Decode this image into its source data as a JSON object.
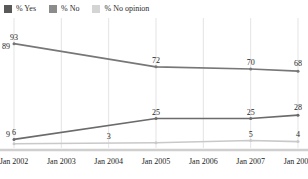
{
  "legend": {
    "position": "top-left",
    "items": [
      {
        "label": "% Yes",
        "color": "#595959",
        "swatch_icon": "square-swatch"
      },
      {
        "label": "% No",
        "color": "#8c8c8c",
        "swatch_icon": "square-swatch"
      },
      {
        "label": "% No opinion",
        "color": "#d4d4d4",
        "swatch_icon": "square-swatch"
      }
    ]
  },
  "axis": {
    "tick_labels": [
      "Jan 2002",
      "Jan 2003",
      "Jan 2004",
      "Jan 2005",
      "Jan 2006",
      "Jan 2007",
      "Jan 2008"
    ]
  },
  "chart_data": {
    "type": "line",
    "title": "",
    "subtitle": "",
    "xlabel": "",
    "ylabel": "",
    "grid": "vertical",
    "legend_position": "top-left",
    "ylim": [
      0,
      100
    ],
    "x": [
      "Jan 2002",
      "Jan 2003",
      "Jan 2004",
      "Jan 2005",
      "Jan 2006",
      "Jan 2007",
      "Jan 2008"
    ],
    "xlim_labels": [
      "Jan 2002",
      "Jan 2008"
    ],
    "series": [
      {
        "name": "% Yes",
        "color": "#777777",
        "values": [
          93,
          null,
          null,
          72,
          null,
          70,
          68
        ],
        "point_labels": [
          {
            "x": "Jan 2002",
            "value": 89,
            "text": "89",
            "anchor": "left"
          },
          {
            "x": "Jan 2002",
            "value": 93,
            "text": "93",
            "anchor": "above"
          },
          {
            "x": "Jan 2005",
            "value": 72,
            "text": "72",
            "anchor": "above"
          },
          {
            "x": "Jan 2007",
            "value": 70,
            "text": "70",
            "anchor": "above"
          },
          {
            "x": "Jan 2008",
            "value": 68,
            "text": "68",
            "anchor": "above"
          }
        ]
      },
      {
        "name": "% No",
        "color": "#6b6b6b",
        "values": [
          6,
          null,
          null,
          25,
          null,
          25,
          28
        ],
        "point_labels": [
          {
            "x": "Jan 2002",
            "value": 9,
            "text": "9",
            "anchor": "left"
          },
          {
            "x": "Jan 2002",
            "value": 6,
            "text": "6",
            "anchor": "above"
          },
          {
            "x": "Jan 2005",
            "value": 25,
            "text": "25",
            "anchor": "above"
          },
          {
            "x": "Jan 2007",
            "value": 25,
            "text": "25",
            "anchor": "above"
          },
          {
            "x": "Jan 2008",
            "value": 28,
            "text": "28",
            "anchor": "above"
          }
        ]
      },
      {
        "name": "% No opinion",
        "color": "#c9c9c9",
        "values": [
          2,
          null,
          null,
          3,
          null,
          5,
          4
        ],
        "point_labels": [
          {
            "x": "Jan 2004",
            "value": 3,
            "text": "3",
            "anchor": "above"
          },
          {
            "x": "Jan 2007",
            "value": 5,
            "text": "5",
            "anchor": "above"
          },
          {
            "x": "Jan 2008",
            "value": 4,
            "text": "4",
            "anchor": "above"
          }
        ]
      }
    ],
    "colors": {
      "yes": "#595959",
      "no": "#8c8c8c",
      "no_opinion": "#d4d4d4",
      "gridline": "#d9d9d9",
      "baseline": "#cfcfcf",
      "text": "#1d1d1d"
    }
  }
}
